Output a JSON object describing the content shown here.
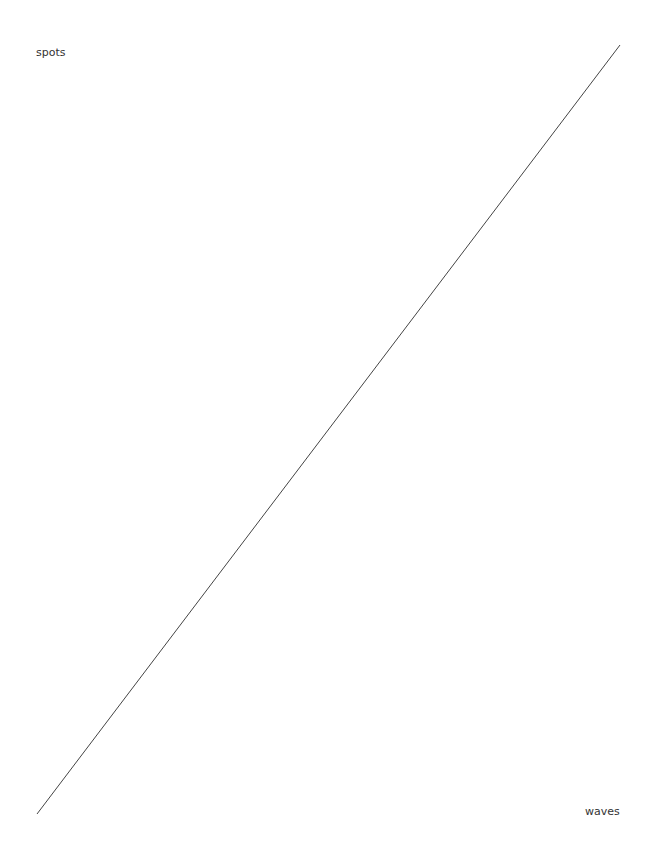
{
  "labels": {
    "top_left": "spots",
    "bottom_right": "waves"
  },
  "line": {
    "x1": 620,
    "y1": 45,
    "x2": 37,
    "y2": 814,
    "color": "#444444"
  }
}
